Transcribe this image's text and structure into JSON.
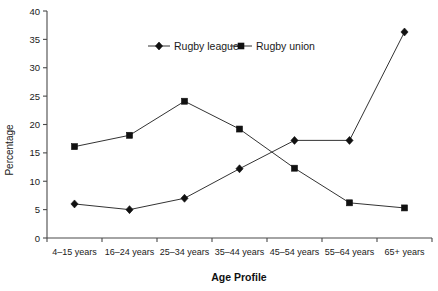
{
  "chart_data": {
    "type": "line",
    "title": "",
    "xlabel": "Age Profile",
    "ylabel": "Percentage",
    "categories": [
      "4–15 years",
      "16–24 years",
      "25–34 years",
      "35–44 years",
      "45–54 years",
      "55–64 years",
      "65+ years"
    ],
    "series": [
      {
        "name": "Rugby league",
        "marker": "diamond",
        "color": "#111111",
        "values": [
          6,
          5,
          7,
          12.2,
          17.2,
          17.2,
          36.3
        ]
      },
      {
        "name": "Rugby union",
        "marker": "square",
        "color": "#111111",
        "values": [
          16.1,
          18.1,
          24.1,
          19.2,
          12.3,
          6.2,
          5.3
        ]
      }
    ],
    "ylim": [
      0,
      40
    ],
    "ytick_step": 5,
    "yticks": [
      0,
      5,
      10,
      15,
      20,
      25,
      30,
      35,
      40
    ],
    "ytick_labels": [
      "0",
      "5",
      "10",
      "15",
      "20",
      "25",
      "30",
      "35",
      "40"
    ],
    "grid": false,
    "legend_position": "top-center"
  },
  "legend": {
    "entries": [
      {
        "label": "Rugby league",
        "marker": "diamond-icon"
      },
      {
        "label": "Rugby union",
        "marker": "square-icon"
      }
    ]
  }
}
